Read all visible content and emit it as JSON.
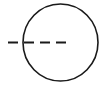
{
  "diagram": {
    "background": "#ffffff",
    "stroke_color": "#1a1a1a",
    "circle": {
      "cx": 60.5,
      "cy": 42.5,
      "rx": 37.5,
      "ry": 38.5,
      "stroke_width": 1.6
    },
    "dashed_line": {
      "x1": 8,
      "y1": 42.5,
      "x2": 70,
      "y2": 42.5,
      "stroke_width": 1.8,
      "dash_pattern": "10,6"
    }
  }
}
